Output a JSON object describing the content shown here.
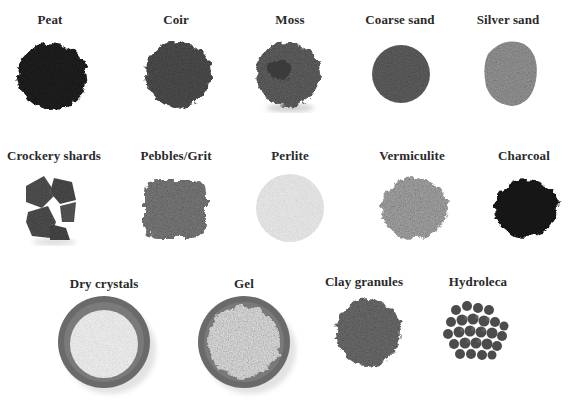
{
  "rows": [
    {
      "items": [
        {
          "id": "peat",
          "label": "Peat"
        },
        {
          "id": "coir",
          "label": "Coir"
        },
        {
          "id": "moss",
          "label": "Moss"
        },
        {
          "id": "coarse-sand",
          "label": "Coarse sand"
        },
        {
          "id": "silver-sand",
          "label": "Silver sand"
        }
      ]
    },
    {
      "items": [
        {
          "id": "crockery-shards",
          "label": "Crockery shards"
        },
        {
          "id": "pebbles-grit",
          "label": "Pebbles/Grit"
        },
        {
          "id": "perlite",
          "label": "Perlite"
        },
        {
          "id": "vermiculite",
          "label": "Vermiculite"
        },
        {
          "id": "charcoal",
          "label": "Charcoal"
        }
      ]
    },
    {
      "items": [
        {
          "id": "dry-crystals",
          "label": "Dry crystals"
        },
        {
          "id": "gel",
          "label": "Gel"
        },
        {
          "id": "clay-granules",
          "label": "Clay granules"
        },
        {
          "id": "hydroleca",
          "label": "Hydroleca"
        }
      ]
    }
  ],
  "colors": {
    "background": "#ffffff",
    "label": "#2a2a2a",
    "peat": "#1c1c1c",
    "coir": "#4a4a4a",
    "moss": "#5a5a5a",
    "coarse_sand": "#5e5e5e",
    "silver_sand": "#8e8e8e",
    "crockery": "#565656",
    "pebbles": "#7a7a7a",
    "perlite": "#e8e8e8",
    "vermiculite": "#a5a5a5",
    "charcoal": "#151515",
    "bowl": "#6a6a6a",
    "clay": "#6b6b6b",
    "hydroleca": "#4c4c4c"
  }
}
